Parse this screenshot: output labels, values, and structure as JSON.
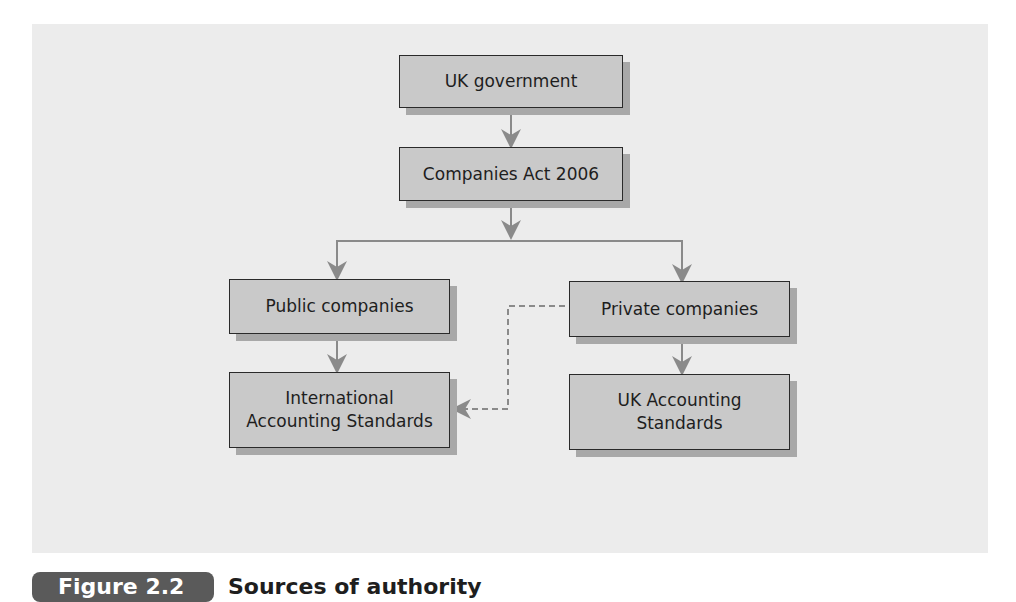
{
  "diagram": {
    "nodes": {
      "uk_government": "UK government",
      "companies_act": "Companies Act 2006",
      "public_companies": "Public companies",
      "private_companies": "Private companies",
      "ias": "International Accounting Standards",
      "ukas": "UK Accounting Standards"
    },
    "edges": [
      {
        "from": "uk_government",
        "to": "companies_act",
        "style": "solid"
      },
      {
        "from": "companies_act",
        "to": "public_companies",
        "style": "solid"
      },
      {
        "from": "companies_act",
        "to": "private_companies",
        "style": "solid"
      },
      {
        "from": "public_companies",
        "to": "ias",
        "style": "solid"
      },
      {
        "from": "private_companies",
        "to": "ukas",
        "style": "solid"
      },
      {
        "from": "private_companies",
        "to": "ias",
        "style": "dashed"
      }
    ]
  },
  "caption": {
    "label": "Figure 2.2",
    "title": "Sources of authority"
  },
  "colors": {
    "panel": "#ececec",
    "box_fill": "#c9c9c9",
    "box_border": "#2a2a2a",
    "shadow": "#a8a8a8",
    "connector": "#8a8a8a",
    "caption_pill": "#5a5a5a"
  }
}
